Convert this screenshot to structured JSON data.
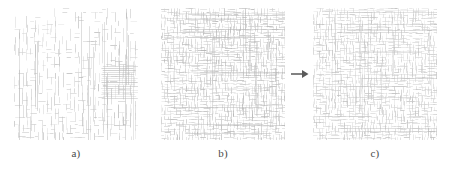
{
  "figure": {
    "type": "multi-panel-texture-figure",
    "background_color": "#ffffff",
    "width": 450,
    "height": 171
  },
  "panels": [
    {
      "id": "panel-a",
      "label": "a)",
      "x": 14,
      "y": 8,
      "width": 124,
      "height": 132,
      "texture": {
        "style": "sparse-vertical-strokes-with-grid",
        "line_color": "#cfcfcf",
        "accent_color": "#b8b8b8",
        "primary_orientation": "vertical",
        "cell_size": 4,
        "density": 0.55,
        "stripe_region": {
          "orientation": "horizontal",
          "x": 86,
          "y": 58,
          "width": 38,
          "height": 34
        }
      }
    },
    {
      "id": "panel-b",
      "label": "b)",
      "x": 161,
      "y": 8,
      "width": 124,
      "height": 132,
      "texture": {
        "style": "dense-woven-dashes",
        "line_color": "#cdcdcd",
        "accent_color": "#b4b4b4",
        "primary_orientation": "mixed",
        "cell_size": 3,
        "density": 0.9
      }
    },
    {
      "id": "panel-c",
      "label": "c)",
      "x": 313,
      "y": 8,
      "width": 124,
      "height": 132,
      "texture": {
        "style": "regular-woven-dashes",
        "line_color": "#d2d2d2",
        "accent_color": "#bcbcbc",
        "primary_orientation": "mixed",
        "cell_size": 3,
        "density": 0.82
      }
    }
  ],
  "labels": {
    "a": "a)",
    "b": "b)",
    "c": "c)",
    "label_y": 147,
    "color": "#4a4a4a"
  },
  "arrow": {
    "name": "transformation-arrow",
    "direction": "right",
    "x": 291,
    "y": 68,
    "width": 18,
    "height": 12,
    "color": "#5a5a5a"
  }
}
